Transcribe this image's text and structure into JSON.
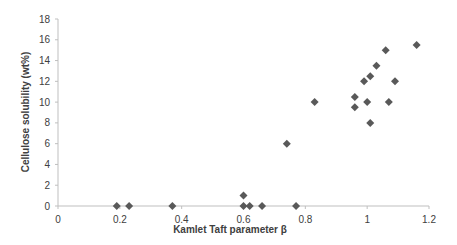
{
  "chart_data": {
    "type": "scatter",
    "title": "",
    "xlabel": "Kamlet Taft parameter β",
    "ylabel": "Cellulose solubility (wt%)",
    "xlim": [
      0,
      1.2
    ],
    "ylim": [
      0,
      18
    ],
    "x_ticks": [
      0,
      0.2,
      0.4,
      0.6,
      0.8,
      1,
      1.2
    ],
    "x_tick_labels": [
      "0",
      "0.2",
      "0.4",
      "0.6",
      "0.8",
      "1",
      "1.2"
    ],
    "y_ticks": [
      0,
      2,
      4,
      6,
      8,
      10,
      12,
      14,
      16,
      18
    ],
    "y_tick_labels": [
      "0",
      "2",
      "4",
      "6",
      "8",
      "10",
      "12",
      "14",
      "16",
      "18"
    ],
    "grid": false,
    "legend": null,
    "marker": "diamond",
    "marker_color": "#595959",
    "series": [
      {
        "name": "data",
        "points": [
          {
            "x": 0.19,
            "y": 0
          },
          {
            "x": 0.23,
            "y": 0
          },
          {
            "x": 0.37,
            "y": 0
          },
          {
            "x": 0.6,
            "y": 1
          },
          {
            "x": 0.6,
            "y": 0
          },
          {
            "x": 0.62,
            "y": 0
          },
          {
            "x": 0.66,
            "y": 0
          },
          {
            "x": 0.74,
            "y": 6
          },
          {
            "x": 0.77,
            "y": 0
          },
          {
            "x": 0.83,
            "y": 10
          },
          {
            "x": 0.96,
            "y": 10.5
          },
          {
            "x": 0.96,
            "y": 9.5
          },
          {
            "x": 0.99,
            "y": 12
          },
          {
            "x": 1.0,
            "y": 10
          },
          {
            "x": 1.01,
            "y": 12.5
          },
          {
            "x": 1.01,
            "y": 8
          },
          {
            "x": 1.03,
            "y": 13.5
          },
          {
            "x": 1.06,
            "y": 15
          },
          {
            "x": 1.07,
            "y": 10
          },
          {
            "x": 1.09,
            "y": 12
          },
          {
            "x": 1.16,
            "y": 15.5
          }
        ]
      }
    ]
  }
}
